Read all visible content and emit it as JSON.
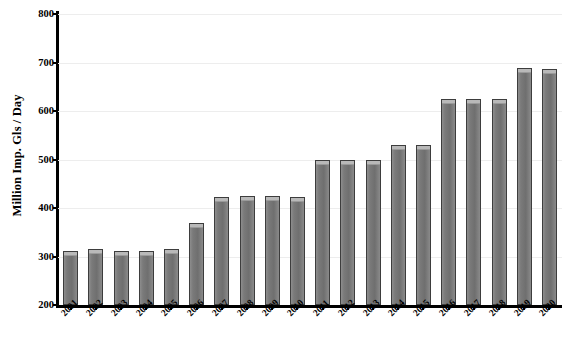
{
  "chart_data": {
    "type": "bar",
    "title": "",
    "subtitle": "",
    "xlabel": "",
    "ylabel": "Million Imp. Gls / Day",
    "ylim": [
      200,
      800
    ],
    "yticks": [
      200,
      300,
      400,
      500,
      600,
      700,
      800
    ],
    "ytick_labels": [
      "200",
      "300",
      "400",
      "500",
      "600",
      "700",
      "800"
    ],
    "grid": true,
    "legend": false,
    "legend_position": "none",
    "categories": [
      "2001",
      "2002",
      "2003",
      "2004",
      "2005",
      "2006",
      "2007",
      "2008",
      "2009",
      "2010",
      "2011",
      "2012",
      "2013",
      "2014",
      "2015",
      "2016",
      "2017",
      "2018",
      "2019",
      "2020"
    ],
    "values": [
      312,
      315,
      312,
      312,
      315,
      370,
      422,
      425,
      425,
      423,
      500,
      500,
      500,
      530,
      530,
      625,
      625,
      625,
      688,
      686
    ],
    "bar_color": "#787878",
    "bar_edge_color": "#3d3d3d",
    "axis_color": "#000000",
    "grid_color": "#ededed",
    "background_color": "#ffffff"
  }
}
